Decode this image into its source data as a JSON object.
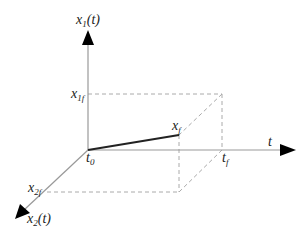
{
  "diagram": {
    "type": "3d-axes-trajectory",
    "axes": {
      "vertical": {
        "label_main": "x",
        "label_sub": "1",
        "label_arg": "(t)"
      },
      "horizontal": {
        "label": "t"
      },
      "depth": {
        "label_main": "x",
        "label_sub": "2",
        "label_arg": "(t)"
      }
    },
    "labels": {
      "origin": {
        "main": "t",
        "sub": "0"
      },
      "x1f": {
        "main": "x",
        "sub": "1f"
      },
      "x2f": {
        "main": "x",
        "sub": "2f"
      },
      "xf": {
        "main": "x",
        "sub": "f"
      },
      "tf": {
        "main": "t",
        "sub": "f"
      }
    },
    "colors": {
      "axis": "#999999",
      "dashed": "#aaaaaa",
      "trajectory": "#222222",
      "arrow": "#000000",
      "text": "#222222"
    }
  }
}
